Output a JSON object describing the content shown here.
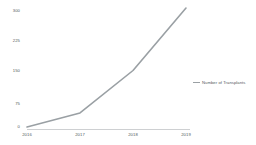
{
  "chart_data": {
    "type": "line",
    "title": "",
    "xlabel": "",
    "ylabel": "",
    "categories": [
      "2016",
      "2017",
      "2018",
      "2019"
    ],
    "series": [
      {
        "name": "Number of Transplants",
        "values": [
          5,
          40,
          145,
          300
        ],
        "color": "#9aa0a4"
      }
    ],
    "ytick_labels": [
      "300",
      "225",
      "150",
      "75",
      "0"
    ],
    "ylim": [
      0,
      300
    ],
    "grid": false,
    "legend_position": "right"
  },
  "axis": {
    "y_labels": [
      {
        "text": "300"
      },
      {
        "text": "225"
      },
      {
        "text": "150"
      },
      {
        "text": "75"
      },
      {
        "text": "0"
      }
    ],
    "x_labels": [
      {
        "text": "2016"
      },
      {
        "text": "2017"
      },
      {
        "text": "2018"
      },
      {
        "text": "2019"
      }
    ]
  },
  "legend": {
    "items": [
      {
        "label": "Number of Transplants",
        "color": "#9aa0a4"
      }
    ]
  },
  "colors": {
    "line": "#9aa0a4",
    "axis": "#b9bcbf",
    "text": "#555a5e",
    "background": "#ffffff"
  }
}
